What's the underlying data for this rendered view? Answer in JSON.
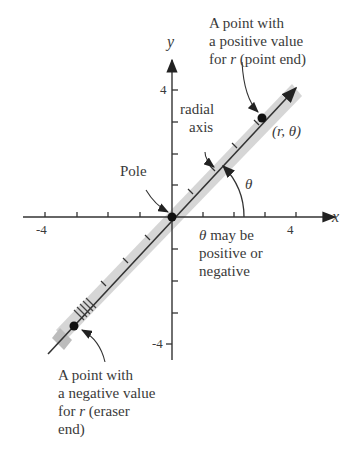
{
  "axes": {
    "x_label": "x",
    "y_label": "y",
    "x_ticks": [
      "-4",
      "4"
    ],
    "y_ticks": [
      "4",
      "-4"
    ]
  },
  "labels": {
    "positive_point": {
      "line1": "A point with",
      "line2": "a positive value",
      "line3_pre": "for ",
      "line3_var": "r",
      "line3_post": " (point end)"
    },
    "radial_axis": {
      "line1": "radial",
      "line2": "axis"
    },
    "pole": "Pole",
    "theta": "θ",
    "point_coords": "(r, θ)",
    "theta_note": {
      "line1_var": "θ",
      "line1_post": " may be",
      "line2": "positive or",
      "line3": "negative"
    },
    "negative_point": {
      "line1": "A point with",
      "line2": "a negative value",
      "line3_pre": "for ",
      "line3_var": "r",
      "line3_post": " (eraser",
      "line4": "end)"
    }
  },
  "colors": {
    "axis": "#333333",
    "pencil": "#d0d0d0",
    "pencil_edge": "#bbbbbb"
  }
}
